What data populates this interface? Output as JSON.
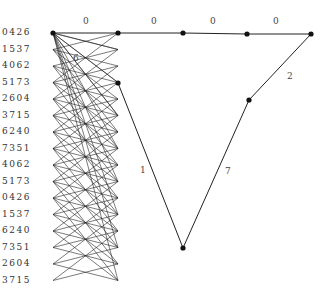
{
  "row_labels": [
    "0426",
    "1537",
    "4062",
    "5173",
    "2604",
    "3715",
    "6240",
    "7351",
    "4062",
    "5173",
    "0426",
    "1537",
    "6240",
    "7351",
    "2604",
    "3715"
  ],
  "row_y_start": 33,
  "row_spacing": 16.5,
  "left_x": 53,
  "right_x": 118,
  "bipartite_offsets": [
    -3,
    -1,
    1,
    3,
    5
  ],
  "nodes": [
    {
      "id": "a",
      "x": 53,
      "y": 33
    },
    {
      "id": "b",
      "x": 118,
      "y": 33
    },
    {
      "id": "c",
      "x": 183,
      "y": 33
    },
    {
      "id": "d",
      "x": 247,
      "y": 34
    },
    {
      "id": "e",
      "x": 311,
      "y": 34
    },
    {
      "id": "f",
      "x": 118,
      "y": 83
    },
    {
      "id": "g",
      "x": 249,
      "y": 100
    },
    {
      "id": "h",
      "x": 183,
      "y": 248
    }
  ],
  "edges": [
    {
      "from": "a",
      "to": "b",
      "label": "0",
      "lx": 83,
      "ly": 16
    },
    {
      "from": "b",
      "to": "c",
      "label": "0",
      "lx": 151,
      "ly": 16
    },
    {
      "from": "c",
      "to": "d",
      "label": "0",
      "lx": 210,
      "ly": 16
    },
    {
      "from": "d",
      "to": "e",
      "label": "0",
      "lx": 273,
      "ly": 16
    },
    {
      "from": "e",
      "to": "g",
      "label": "2",
      "lx": 287,
      "ly": 71
    },
    {
      "from": "g",
      "to": "h",
      "label": "7",
      "lx": 225,
      "ly": 166
    },
    {
      "from": "f",
      "to": "h",
      "label": "1",
      "lx": 140,
      "ly": 165
    }
  ],
  "extra_labels": [
    {
      "text": "6",
      "x": 73,
      "y": 53
    }
  ]
}
